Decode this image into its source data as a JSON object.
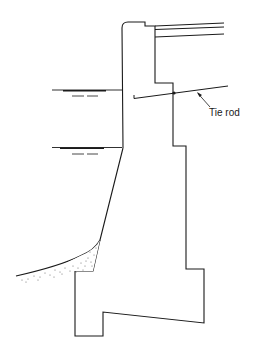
{
  "diagram": {
    "type": "cross-section",
    "labels": {
      "tie_rod": "Tie rod"
    },
    "colors": {
      "line": "#1a1a1a",
      "background": "#ffffff",
      "soil": "#555555"
    },
    "elements": [
      {
        "name": "wall-section",
        "kind": "outline"
      },
      {
        "name": "deck-lines",
        "kind": "lines",
        "count": 3
      },
      {
        "name": "high-water-level",
        "kind": "water-line"
      },
      {
        "name": "low-water-level",
        "kind": "water-line"
      },
      {
        "name": "tie-rod",
        "kind": "rod"
      },
      {
        "name": "seabed-soil",
        "kind": "stippled-curve"
      }
    ]
  }
}
